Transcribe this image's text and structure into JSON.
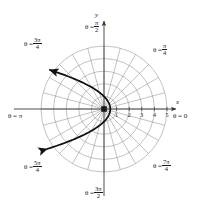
{
  "figure": {
    "kind": "polar-plot",
    "background_color": "#ffffff",
    "ink_color": "#1a1a1a",
    "grid_color": "#8a8a8a",
    "axis_color": "#4d4d4d",
    "curve_color": "#111111"
  },
  "axes": {
    "x_label": "x",
    "y_label": "y",
    "origin_px": {
      "x": 104,
      "y": 109
    },
    "unit_px": 12.6,
    "x_ticks": [
      "1",
      "2",
      "3",
      "4",
      "5"
    ],
    "x_tick_values": [
      1,
      2,
      3,
      4,
      5
    ]
  },
  "angle_labels": [
    {
      "id": "theta-0",
      "text": "θ = 0",
      "theta_deg": 0,
      "numerator": "",
      "denominator": ""
    },
    {
      "id": "theta-pi-4",
      "text": "θ =",
      "theta_deg": 45,
      "numerator": "π",
      "denominator": "4"
    },
    {
      "id": "theta-pi-2",
      "text": "θ =",
      "theta_deg": 90,
      "numerator": "π",
      "denominator": "2"
    },
    {
      "id": "theta-3pi-4",
      "text": "θ =",
      "theta_deg": 135,
      "numerator": "3π",
      "denominator": "4"
    },
    {
      "id": "theta-pi",
      "text": "θ = π",
      "theta_deg": 180,
      "numerator": "",
      "denominator": ""
    },
    {
      "id": "theta-5pi-4",
      "text": "θ =",
      "theta_deg": 225,
      "numerator": "5π",
      "denominator": "4"
    },
    {
      "id": "theta-3pi-2",
      "text": "θ =",
      "theta_deg": 270,
      "numerator": "3π",
      "denominator": "2"
    },
    {
      "id": "theta-7pi-4",
      "text": "θ =",
      "theta_deg": 315,
      "numerator": "7π",
      "denominator": "4"
    }
  ],
  "chart_data": {
    "type": "line",
    "coordinate_system": "polar",
    "title": "",
    "xlabel": "x",
    "ylabel": "y",
    "grid": true,
    "legend": null,
    "polar_grid": {
      "radial_circles": [
        1,
        2,
        3,
        4,
        5
      ],
      "n_circles": 5,
      "ray_step_deg": 15,
      "n_rays": 24,
      "r_max": 5
    },
    "axis_ranges": {
      "r": [
        0,
        5
      ],
      "theta_deg": [
        0,
        360
      ]
    },
    "series": [
      {
        "name": "r = 1/(1 + cos θ)",
        "equation": "r = 1/(1 + cos(theta))",
        "shape": "parabola opening left",
        "arrow_start": true,
        "arrow_end": true,
        "points_polar": [
          {
            "theta_deg": 0,
            "r": 0.5
          },
          {
            "theta_deg": 15,
            "r": 0.51
          },
          {
            "theta_deg": 30,
            "r": 0.54
          },
          {
            "theta_deg": 45,
            "r": 0.59
          },
          {
            "theta_deg": 60,
            "r": 0.67
          },
          {
            "theta_deg": 75,
            "r": 0.8
          },
          {
            "theta_deg": 90,
            "r": 1.0
          },
          {
            "theta_deg": 105,
            "r": 1.35
          },
          {
            "theta_deg": 120,
            "r": 2.0
          },
          {
            "theta_deg": 135,
            "r": 3.41
          },
          {
            "theta_deg": 145,
            "r": 5.39
          },
          {
            "theta_deg": 215,
            "r": 5.39
          },
          {
            "theta_deg": 225,
            "r": 3.41
          },
          {
            "theta_deg": 240,
            "r": 2.0
          },
          {
            "theta_deg": 255,
            "r": 1.35
          },
          {
            "theta_deg": 270,
            "r": 1.0
          },
          {
            "theta_deg": 285,
            "r": 0.8
          },
          {
            "theta_deg": 300,
            "r": 0.67
          },
          {
            "theta_deg": 315,
            "r": 0.59
          },
          {
            "theta_deg": 330,
            "r": 0.54
          },
          {
            "theta_deg": 345,
            "r": 0.51
          },
          {
            "theta_deg": 360,
            "r": 0.5
          }
        ],
        "vertex_cartesian": {
          "x": 0.5,
          "y": 0
        },
        "crosses_theta_pi_2_at_r": 1.0,
        "crosses_theta_pi_4_at_r": 0.59,
        "crosses_theta_3pi_4_at_r": 3.41
      }
    ]
  }
}
